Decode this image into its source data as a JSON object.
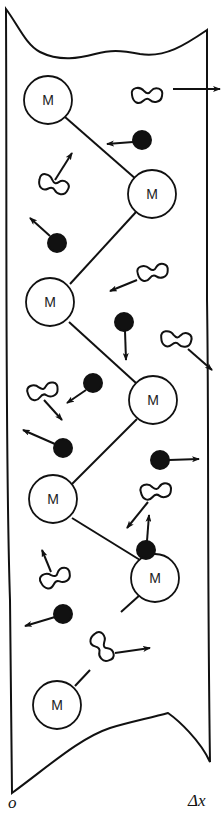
{
  "diagram": {
    "axis_labels": {
      "left": "o",
      "right": "Δx"
    },
    "monomer_label": "M",
    "monomers": [
      {
        "id": 1,
        "label": "M",
        "cx": 48,
        "cy": 100
      },
      {
        "id": 2,
        "label": "M",
        "cx": 152,
        "cy": 194
      },
      {
        "id": 3,
        "label": "M",
        "cx": 50,
        "cy": 302
      },
      {
        "id": 4,
        "label": "M",
        "cx": 153,
        "cy": 400
      },
      {
        "id": 5,
        "label": "M",
        "cx": 53,
        "cy": 499
      },
      {
        "id": 6,
        "label": "M",
        "cx": 155,
        "cy": 578
      },
      {
        "id": 7,
        "label": "M",
        "cx": 57,
        "cy": 705
      }
    ],
    "colors": {
      "stroke": "#111111",
      "fill_dot": "#111111",
      "background": "#ffffff"
    }
  }
}
